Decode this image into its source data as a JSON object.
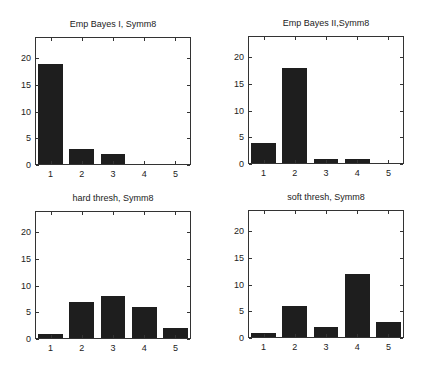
{
  "chart_data": [
    {
      "type": "bar",
      "title": "Emp Bayes I, Symm8",
      "categories": [
        "1",
        "2",
        "3",
        "4",
        "5"
      ],
      "values": [
        19,
        3,
        2,
        0,
        0
      ],
      "xlabel": "",
      "ylabel": "",
      "ylim": [
        0,
        24
      ],
      "yticks": [
        0,
        5,
        10,
        15,
        20
      ],
      "grid": false,
      "bar_color": "#1e1e1e"
    },
    {
      "type": "bar",
      "title": "Emp Bayes II,Symm8",
      "categories": [
        "1",
        "2",
        "3",
        "4",
        "5"
      ],
      "values": [
        4,
        18,
        1,
        1,
        0
      ],
      "xlabel": "",
      "ylabel": "",
      "ylim": [
        0,
        24
      ],
      "yticks": [
        0,
        5,
        10,
        15,
        20
      ],
      "grid": false,
      "bar_color": "#1e1e1e"
    },
    {
      "type": "bar",
      "title": "hard thresh, Symm8",
      "categories": [
        "1",
        "2",
        "3",
        "4",
        "5"
      ],
      "values": [
        1,
        7,
        8,
        6,
        2
      ],
      "xlabel": "",
      "ylabel": "",
      "ylim": [
        0,
        24
      ],
      "yticks": [
        0,
        5,
        10,
        15,
        20
      ],
      "grid": false,
      "bar_color": "#1e1e1e"
    },
    {
      "type": "bar",
      "title": "soft thresh, Symm8",
      "categories": [
        "1",
        "2",
        "3",
        "4",
        "5"
      ],
      "values": [
        1,
        6,
        2,
        12,
        3
      ],
      "xlabel": "",
      "ylabel": "",
      "ylim": [
        0,
        24
      ],
      "yticks": [
        0,
        5,
        10,
        15,
        20
      ],
      "grid": false,
      "bar_color": "#1e1e1e"
    }
  ],
  "layout": {
    "panels": [
      {
        "left": 35,
        "top": 37,
        "width": 156,
        "height": 128,
        "title_y": 19
      },
      {
        "left": 248,
        "top": 36,
        "width": 156,
        "height": 128,
        "title_y": 18
      },
      {
        "left": 35,
        "top": 211,
        "width": 156,
        "height": 128,
        "title_y": 193
      },
      {
        "left": 248,
        "top": 210,
        "width": 156,
        "height": 128,
        "title_y": 192
      }
    ]
  }
}
